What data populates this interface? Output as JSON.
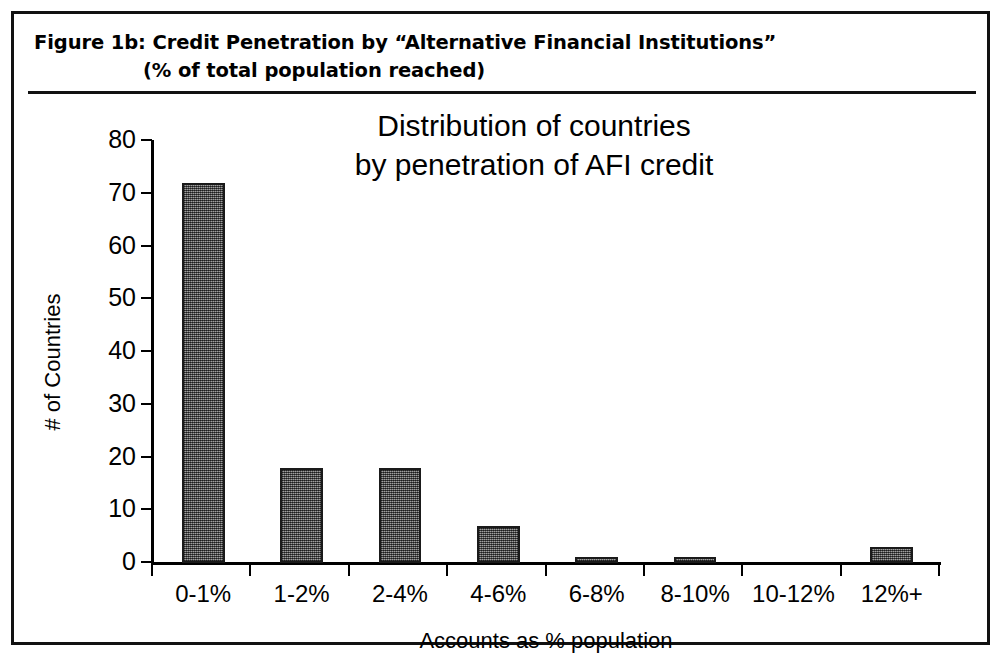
{
  "figure": {
    "caption_line_1": "Figure 1b:  Credit Penetration by “Alternative Financial Institutions”",
    "caption_line_2": "(% of total population reached)"
  },
  "chart_data": {
    "type": "bar",
    "title_line_1": "Distribution of countries",
    "title_line_2": "by penetration of AFI credit",
    "title": "Distribution of countries by penetration of AFI credit",
    "categories": [
      "0-1%",
      "1-2%",
      "2-4%",
      "4-6%",
      "6-8%",
      "8-10%",
      "10-12%",
      "12%+"
    ],
    "values": [
      72,
      18,
      18,
      7,
      1,
      1,
      0,
      3
    ],
    "xlabel": "Accounts as % population",
    "ylabel": "# of Countries",
    "ylim": [
      0,
      80
    ],
    "ytick_labels": [
      "80",
      "70",
      "60",
      "50",
      "40",
      "30",
      "20",
      "10",
      "0"
    ],
    "ytick_values": [
      80,
      70,
      60,
      50,
      40,
      30,
      20,
      10,
      0
    ],
    "grid": false,
    "legend": "none",
    "bar_fill_color": "#767676",
    "bar_border_color": "#1a1a1a",
    "axis_color": "#000000"
  }
}
